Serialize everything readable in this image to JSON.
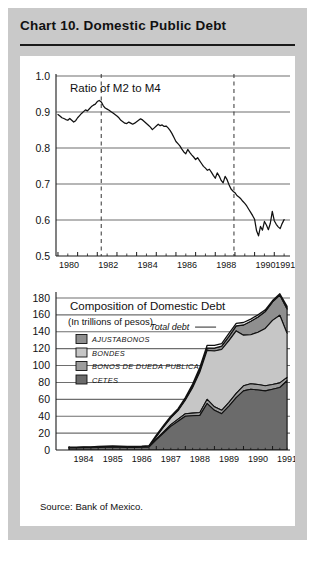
{
  "header": {
    "title": "Chart 10. Domestic Public Debt"
  },
  "source_note": "Source:  Bank of Mexico.",
  "colors": {
    "plate": "#c9c9c9",
    "card": "#ffffff",
    "ink": "#1a1a1a",
    "gridline": "#6e6e6e",
    "ajustabonos": "#8f8f8f",
    "bondes": "#c6c6c6",
    "bonos_deuda": "#9d9d9d",
    "cetes": "#6b6b6b",
    "total_debt_fill": "#ffffff"
  },
  "chart_data": [
    {
      "id": "ratio-m2-m4",
      "type": "line",
      "title": "Ratio of M2 to M4",
      "xlabel": "",
      "ylabel": "",
      "ylim": [
        0.5,
        1.0
      ],
      "yticks": [
        "1.0",
        "0.9",
        "0.8",
        "0.7",
        "0.6",
        "0.5"
      ],
      "ytick_values": [
        1.0,
        0.9,
        0.8,
        0.7,
        0.6,
        0.5
      ],
      "xlim": [
        1979.9,
        1991.8
      ],
      "xticks": [
        1980,
        1982,
        1984,
        1986,
        1988,
        1990,
        1991
      ],
      "xtick_labels": [
        "1980",
        "1982",
        "1984",
        "1986",
        "1988",
        "1990",
        "1991"
      ],
      "grid": true,
      "legend": "none",
      "annotations": [
        {
          "name": "vline-1982",
          "type": "vline",
          "x": 1982.2,
          "style": "dashed"
        },
        {
          "name": "vline-1989",
          "type": "vline",
          "x": 1988.95,
          "style": "dashed"
        }
      ],
      "series": [
        {
          "name": "Ratio of M2 to M4",
          "x": [
            1980.0,
            1980.1,
            1980.2,
            1980.3,
            1980.4,
            1980.5,
            1980.6,
            1980.7,
            1980.8,
            1980.9,
            1981.0,
            1981.1,
            1981.2,
            1981.3,
            1981.4,
            1981.5,
            1981.6,
            1981.7,
            1981.8,
            1981.9,
            1982.0,
            1982.1,
            1982.2,
            1982.3,
            1982.4,
            1982.5,
            1982.6,
            1982.7,
            1982.8,
            1982.9,
            1983.0,
            1983.1,
            1983.2,
            1983.3,
            1983.4,
            1983.5,
            1983.6,
            1983.7,
            1983.8,
            1983.9,
            1984.0,
            1984.1,
            1984.2,
            1984.3,
            1984.4,
            1984.5,
            1984.6,
            1984.7,
            1984.8,
            1984.9,
            1985.0,
            1985.1,
            1985.2,
            1985.3,
            1985.4,
            1985.5,
            1985.6,
            1985.7,
            1985.8,
            1985.9,
            1986.0,
            1986.1,
            1986.2,
            1986.3,
            1986.4,
            1986.5,
            1986.6,
            1986.7,
            1986.8,
            1986.9,
            1987.0,
            1987.1,
            1987.2,
            1987.3,
            1987.4,
            1987.5,
            1987.6,
            1987.7,
            1987.8,
            1987.9,
            1988.0,
            1988.1,
            1988.2,
            1988.3,
            1988.4,
            1988.5,
            1988.6,
            1988.7,
            1988.8,
            1988.9,
            1989.0,
            1989.1,
            1989.2,
            1989.3,
            1989.4,
            1989.5,
            1989.6,
            1989.7,
            1989.8,
            1989.9,
            1990.0,
            1990.1,
            1990.2,
            1990.3,
            1990.4,
            1990.5,
            1990.6,
            1990.7,
            1990.8,
            1990.9,
            1991.0,
            1991.1,
            1991.2,
            1991.3,
            1991.4,
            1991.5
          ],
          "y": [
            0.893,
            0.889,
            0.884,
            0.882,
            0.879,
            0.877,
            0.882,
            0.877,
            0.872,
            0.876,
            0.884,
            0.89,
            0.896,
            0.901,
            0.906,
            0.903,
            0.909,
            0.915,
            0.919,
            0.922,
            0.929,
            0.932,
            0.928,
            0.918,
            0.911,
            0.908,
            0.905,
            0.901,
            0.897,
            0.893,
            0.889,
            0.884,
            0.877,
            0.873,
            0.869,
            0.868,
            0.872,
            0.869,
            0.866,
            0.869,
            0.873,
            0.877,
            0.881,
            0.878,
            0.873,
            0.868,
            0.863,
            0.858,
            0.851,
            0.856,
            0.861,
            0.866,
            0.862,
            0.864,
            0.86,
            0.861,
            0.856,
            0.849,
            0.84,
            0.829,
            0.818,
            0.812,
            0.806,
            0.797,
            0.789,
            0.784,
            0.796,
            0.788,
            0.781,
            0.775,
            0.768,
            0.773,
            0.765,
            0.757,
            0.749,
            0.744,
            0.738,
            0.741,
            0.733,
            0.724,
            0.716,
            0.731,
            0.722,
            0.71,
            0.703,
            0.721,
            0.712,
            0.698,
            0.686,
            0.68,
            0.676,
            0.668,
            0.664,
            0.659,
            0.652,
            0.646,
            0.639,
            0.63,
            0.621,
            0.612,
            0.602,
            0.57,
            0.556,
            0.582,
            0.572,
            0.596,
            0.586,
            0.573,
            0.591,
            0.624,
            0.598,
            0.588,
            0.581,
            0.576,
            0.59,
            0.601
          ]
        }
      ]
    },
    {
      "id": "composition-domestic-debt",
      "type": "area",
      "title": "Composition of Domestic Debt",
      "subtitle": "(In trillions of pesos)",
      "xlabel": "",
      "ylabel": "",
      "ylim": [
        0,
        180
      ],
      "yticks": [
        "180",
        "160",
        "140",
        "120",
        "100",
        "80",
        "60",
        "40",
        "20",
        "0"
      ],
      "ytick_values": [
        180,
        160,
        140,
        120,
        100,
        80,
        60,
        40,
        20,
        0
      ],
      "xlim": [
        1983.55,
        1991.6
      ],
      "xticks": [
        1984,
        1985,
        1986,
        1987,
        1988,
        1989,
        1990,
        1991
      ],
      "xtick_labels": [
        "1984",
        "1985",
        "1986",
        "1987",
        "1988",
        "1989",
        "1990",
        "1991"
      ],
      "grid": true,
      "stacked": true,
      "legend_position": "upper-left",
      "annotations": [
        {
          "name": "total-debt-label",
          "type": "text",
          "text": "Total debt",
          "x": 1988.3,
          "y": 142
        }
      ],
      "legend": [
        {
          "label": "Ajustabonos",
          "color": "#8f8f8f"
        },
        {
          "label": "Bondes",
          "color": "#c6c6c6"
        },
        {
          "label": "Bonos de dueda publica",
          "color": "#9d9d9d"
        },
        {
          "label": "Cetes",
          "color": "#6b6b6b"
        }
      ],
      "x": [
        1984.0,
        1984.25,
        1984.5,
        1984.75,
        1985.0,
        1985.25,
        1985.5,
        1985.75,
        1986.0,
        1986.25,
        1986.5,
        1986.75,
        1987.0,
        1987.25,
        1987.5,
        1987.75,
        1988.0,
        1988.25,
        1988.5,
        1988.75,
        1989.0,
        1989.25,
        1989.5,
        1989.75,
        1990.0,
        1990.25,
        1990.5,
        1990.75,
        1991.0,
        1991.25,
        1991.5
      ],
      "series": [
        {
          "name": "Cetes",
          "color": "#6b6b6b",
          "values": [
            2.5,
            2.5,
            2.6,
            2.7,
            3.0,
            3.3,
            3.4,
            3.2,
            3.1,
            3.1,
            3.2,
            3.4,
            12.0,
            20.0,
            28.0,
            34.0,
            40.0,
            40.5,
            41.0,
            55.0,
            47.0,
            43.0,
            52.0,
            62.0,
            70.0,
            72.0,
            71.0,
            70.0,
            72.0,
            74.0,
            82.0
          ]
        },
        {
          "name": "Bonos de dueda publica",
          "color": "#9d9d9d",
          "values": [
            0.3,
            0.3,
            0.3,
            0.3,
            0.4,
            0.4,
            0.4,
            0.4,
            0.4,
            0.4,
            0.4,
            0.5,
            1.0,
            1.5,
            2.0,
            2.5,
            3.0,
            3.2,
            3.4,
            5.0,
            4.2,
            4.0,
            4.5,
            5.0,
            6.0,
            6.5,
            6.5,
            6.0,
            5.5,
            5.5,
            4.0
          ]
        },
        {
          "name": "Bondes",
          "color": "#c6c6c6",
          "values": [
            0.2,
            0.2,
            0.2,
            0.2,
            0.3,
            0.3,
            0.3,
            0.3,
            0.3,
            0.3,
            0.4,
            0.6,
            3.0,
            6.0,
            8.0,
            10.0,
            16.0,
            30.0,
            48.0,
            58.0,
            66.0,
            72.0,
            73.0,
            74.0,
            60.0,
            58.0,
            62.0,
            68.0,
            76.0,
            80.0,
            52.0
          ]
        },
        {
          "name": "Ajustabonos",
          "color": "#8f8f8f",
          "values": [
            0.0,
            0.0,
            0.0,
            0.0,
            0.0,
            0.0,
            0.0,
            0.0,
            0.0,
            0.0,
            0.0,
            0.0,
            0.0,
            0.0,
            0.5,
            1.0,
            1.5,
            2.0,
            2.5,
            3.0,
            3.5,
            4.0,
            5.0,
            6.0,
            12.0,
            16.0,
            18.0,
            20.0,
            22.0,
            24.0,
            29.0
          ]
        }
      ],
      "total_debt": [
        3.3,
        3.4,
        3.6,
        3.8,
        4.2,
        4.6,
        4.8,
        4.5,
        4.3,
        4.4,
        4.6,
        5.2,
        17.5,
        29.0,
        40.0,
        49.0,
        62.0,
        78.0,
        98.0,
        124.0,
        124.0,
        126.0,
        138.0,
        150.0,
        151.0,
        155.0,
        160.0,
        166.0,
        177.0,
        185.0,
        170.0
      ]
    }
  ]
}
